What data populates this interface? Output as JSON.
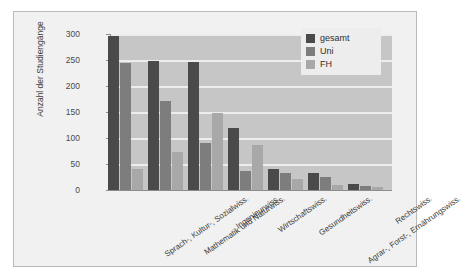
{
  "chart_data": {
    "type": "bar",
    "title": "",
    "xlabel": "",
    "ylabel": "Anzahl der Studiengänge",
    "ylim": [
      0,
      300
    ],
    "yticks": [
      0,
      50,
      100,
      150,
      200,
      250,
      300
    ],
    "grid": true,
    "legend_position": "top-right",
    "categories": [
      "Sprach-, Kultur-, Sozialwiss.",
      "Mathematik und Naturwiss.",
      "Ingenieurwiss.",
      "Wirtschaftswiss.",
      "Gesundheitswiss.",
      "Agrar-, Forst-, Ernährungswiss.",
      "Rechtswiss."
    ],
    "series": [
      {
        "name": "gesamt",
        "color": "#4a4a4a",
        "values": [
          297,
          249,
          246,
          120,
          41,
          32,
          12
        ]
      },
      {
        "name": "Uni",
        "color": "#7d7d7d",
        "values": [
          245,
          172,
          91,
          36,
          32,
          25,
          8
        ]
      },
      {
        "name": "FH",
        "color": "#a8a8a8",
        "values": [
          41,
          73,
          148,
          86,
          21,
          9,
          5
        ]
      }
    ]
  },
  "legend": {
    "items": [
      {
        "label": "gesamt"
      },
      {
        "label": "Uni"
      },
      {
        "label": "FH"
      }
    ]
  },
  "axis": {
    "y_title": "Anzahl der Studiengänge",
    "y_tick_labels": [
      "300",
      "250",
      "200",
      "150",
      "100",
      "50",
      "0"
    ]
  }
}
